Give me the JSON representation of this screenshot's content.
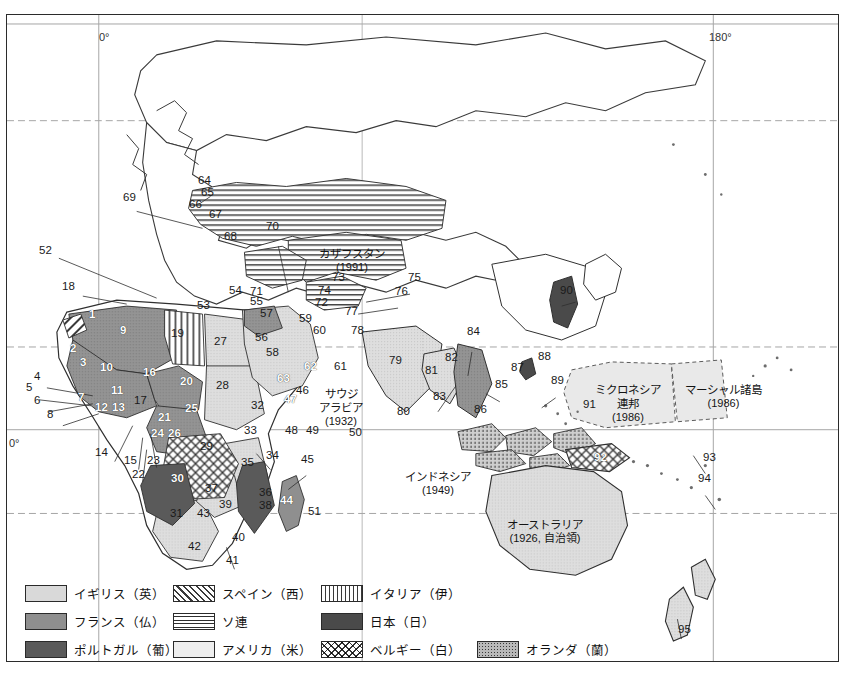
{
  "map": {
    "title_context": "Colonial empires world map with numbered territories",
    "graticule_labels": [
      {
        "id": "meridian-0-top",
        "text": "0°",
        "x": 98,
        "y": 16
      },
      {
        "id": "meridian-180-top",
        "text": "180°",
        "x": 708,
        "y": 16
      },
      {
        "id": "equator-left",
        "text": "0°",
        "x": 6,
        "y": 430
      }
    ],
    "country_labels": [
      {
        "id": "kazakhstan",
        "name": "カザフスタン",
        "year": "(1991)",
        "x": 322,
        "y": 236
      },
      {
        "id": "saudi-arabia",
        "name": "サウジ\nアラビア",
        "line1": "サウジ",
        "line2": "アラビア",
        "year": "(1932)",
        "x": 322,
        "y": 381
      },
      {
        "id": "indonesia",
        "name": "インドネシア",
        "year": "(1949)",
        "x": 411,
        "y": 462
      },
      {
        "id": "australia",
        "name": "オーストラリア",
        "year": "(1926, 自治領)",
        "x": 518,
        "y": 510
      },
      {
        "id": "micronesia",
        "line1": "ミクロネシア",
        "line2": "連邦",
        "year": "(1986)",
        "x": 604,
        "y": 379
      },
      {
        "id": "marshall-islands",
        "name": "マーシャル諸島",
        "year": "(1986)",
        "x": 694,
        "y": 379
      }
    ],
    "region_numbers": [
      {
        "n": "52",
        "x": 38,
        "y": 250,
        "white": false
      },
      {
        "n": "18",
        "x": 61,
        "y": 286,
        "white": false
      },
      {
        "n": "1",
        "x": 88,
        "y": 314,
        "white": true
      },
      {
        "n": "9",
        "x": 119,
        "y": 330,
        "white": true
      },
      {
        "n": "2",
        "x": 69,
        "y": 348,
        "white": true
      },
      {
        "n": "3",
        "x": 79,
        "y": 362,
        "white": true
      },
      {
        "n": "10",
        "x": 99,
        "y": 367,
        "white": true
      },
      {
        "n": "16",
        "x": 142,
        "y": 372,
        "white": true
      },
      {
        "n": "20",
        "x": 179,
        "y": 381,
        "white": true
      },
      {
        "n": "4",
        "x": 33,
        "y": 376,
        "white": false
      },
      {
        "n": "5",
        "x": 25,
        "y": 387,
        "white": false
      },
      {
        "n": "11",
        "x": 110,
        "y": 390,
        "white": true
      },
      {
        "n": "6",
        "x": 33,
        "y": 400,
        "white": false
      },
      {
        "n": "7",
        "x": 77,
        "y": 397,
        "white": true
      },
      {
        "n": "12",
        "x": 94,
        "y": 407,
        "white": true
      },
      {
        "n": "13",
        "x": 111,
        "y": 407,
        "white": true
      },
      {
        "n": "8",
        "x": 46,
        "y": 414,
        "white": false
      },
      {
        "n": "17",
        "x": 133,
        "y": 400,
        "white": false
      },
      {
        "n": "25",
        "x": 184,
        "y": 408,
        "white": true
      },
      {
        "n": "21",
        "x": 157,
        "y": 417,
        "white": true
      },
      {
        "n": "24",
        "x": 150,
        "y": 433,
        "white": true
      },
      {
        "n": "26",
        "x": 167,
        "y": 433,
        "white": true
      },
      {
        "n": "14",
        "x": 94,
        "y": 452,
        "white": false
      },
      {
        "n": "15",
        "x": 123,
        "y": 460,
        "white": false
      },
      {
        "n": "22",
        "x": 131,
        "y": 474,
        "white": false
      },
      {
        "n": "23",
        "x": 146,
        "y": 460,
        "white": false
      },
      {
        "n": "29",
        "x": 199,
        "y": 446,
        "white": false
      },
      {
        "n": "30",
        "x": 170,
        "y": 478,
        "white": true
      },
      {
        "n": "37",
        "x": 204,
        "y": 488,
        "white": false
      },
      {
        "n": "39",
        "x": 218,
        "y": 504,
        "white": false
      },
      {
        "n": "31",
        "x": 169,
        "y": 513,
        "white": false
      },
      {
        "n": "43",
        "x": 196,
        "y": 513,
        "white": false
      },
      {
        "n": "42",
        "x": 187,
        "y": 546,
        "white": false
      },
      {
        "n": "40",
        "x": 231,
        "y": 537,
        "white": false
      },
      {
        "n": "41",
        "x": 225,
        "y": 560,
        "white": false
      },
      {
        "n": "19",
        "x": 170,
        "y": 333,
        "white": false
      },
      {
        "n": "27",
        "x": 213,
        "y": 341,
        "white": false
      },
      {
        "n": "28",
        "x": 215,
        "y": 385,
        "white": false
      },
      {
        "n": "32",
        "x": 250,
        "y": 405,
        "white": false
      },
      {
        "n": "33",
        "x": 243,
        "y": 430,
        "white": false
      },
      {
        "n": "34",
        "x": 265,
        "y": 455,
        "white": false
      },
      {
        "n": "35",
        "x": 240,
        "y": 462,
        "white": false
      },
      {
        "n": "36",
        "x": 258,
        "y": 492,
        "white": false
      },
      {
        "n": "38",
        "x": 258,
        "y": 505,
        "white": false
      },
      {
        "n": "44",
        "x": 279,
        "y": 500,
        "white": true
      },
      {
        "n": "45",
        "x": 300,
        "y": 459,
        "white": false
      },
      {
        "n": "51",
        "x": 307,
        "y": 511,
        "white": false
      },
      {
        "n": "46",
        "x": 295,
        "y": 390,
        "white": false
      },
      {
        "n": "47",
        "x": 283,
        "y": 399,
        "white": true
      },
      {
        "n": "48",
        "x": 284,
        "y": 430,
        "white": false
      },
      {
        "n": "49",
        "x": 305,
        "y": 430,
        "white": false
      },
      {
        "n": "50",
        "x": 348,
        "y": 432,
        "white": false
      },
      {
        "n": "53",
        "x": 196,
        "y": 305,
        "white": false
      },
      {
        "n": "54",
        "x": 228,
        "y": 290,
        "white": false
      },
      {
        "n": "55",
        "x": 249,
        "y": 301,
        "white": false
      },
      {
        "n": "57",
        "x": 259,
        "y": 313,
        "white": false
      },
      {
        "n": "56",
        "x": 254,
        "y": 337,
        "white": false
      },
      {
        "n": "58",
        "x": 265,
        "y": 352,
        "white": false
      },
      {
        "n": "59",
        "x": 298,
        "y": 318,
        "white": false
      },
      {
        "n": "60",
        "x": 312,
        "y": 330,
        "white": false
      },
      {
        "n": "61",
        "x": 333,
        "y": 366,
        "white": false
      },
      {
        "n": "62",
        "x": 303,
        "y": 366,
        "white": true
      },
      {
        "n": "63",
        "x": 276,
        "y": 378,
        "white": true
      },
      {
        "n": "64",
        "x": 197,
        "y": 180,
        "white": false
      },
      {
        "n": "65",
        "x": 200,
        "y": 192,
        "white": false
      },
      {
        "n": "66",
        "x": 188,
        "y": 204,
        "white": false
      },
      {
        "n": "67",
        "x": 208,
        "y": 214,
        "white": false
      },
      {
        "n": "68",
        "x": 223,
        "y": 236,
        "white": false
      },
      {
        "n": "69",
        "x": 122,
        "y": 197,
        "white": false
      },
      {
        "n": "70",
        "x": 265,
        "y": 226,
        "white": false
      },
      {
        "n": "71",
        "x": 249,
        "y": 291,
        "white": false
      },
      {
        "n": "72",
        "x": 314,
        "y": 302,
        "white": false
      },
      {
        "n": "73",
        "x": 331,
        "y": 277,
        "white": false
      },
      {
        "n": "74",
        "x": 317,
        "y": 290,
        "white": false
      },
      {
        "n": "75",
        "x": 407,
        "y": 277,
        "white": false
      },
      {
        "n": "76",
        "x": 394,
        "y": 291,
        "white": false
      },
      {
        "n": "77",
        "x": 344,
        "y": 311,
        "white": false
      },
      {
        "n": "78",
        "x": 350,
        "y": 330,
        "white": false
      },
      {
        "n": "79",
        "x": 388,
        "y": 360,
        "white": false
      },
      {
        "n": "80",
        "x": 396,
        "y": 411,
        "white": false
      },
      {
        "n": "81",
        "x": 424,
        "y": 370,
        "white": false
      },
      {
        "n": "82",
        "x": 444,
        "y": 357,
        "white": false
      },
      {
        "n": "83",
        "x": 432,
        "y": 396,
        "white": false
      },
      {
        "n": "84",
        "x": 466,
        "y": 331,
        "white": false
      },
      {
        "n": "85",
        "x": 494,
        "y": 384,
        "white": false
      },
      {
        "n": "86",
        "x": 473,
        "y": 409,
        "white": false
      },
      {
        "n": "87",
        "x": 510,
        "y": 367,
        "white": false
      },
      {
        "n": "88",
        "x": 537,
        "y": 356,
        "white": false
      },
      {
        "n": "89",
        "x": 550,
        "y": 380,
        "white": false
      },
      {
        "n": "90",
        "x": 559,
        "y": 290,
        "white": false
      },
      {
        "n": "91",
        "x": 582,
        "y": 404,
        "white": false
      },
      {
        "n": "92",
        "x": 593,
        "y": 457,
        "white": true
      },
      {
        "n": "93",
        "x": 702,
        "y": 457,
        "white": false
      },
      {
        "n": "94",
        "x": 697,
        "y": 478,
        "white": false
      },
      {
        "n": "95",
        "x": 677,
        "y": 629,
        "white": false
      }
    ]
  },
  "legend": {
    "items": [
      {
        "id": "uk",
        "label": "イギリス（英）",
        "pattern": "p-uk",
        "col": 0,
        "row": 0
      },
      {
        "id": "spain",
        "label": "スペイン（西）",
        "pattern": "p-es",
        "col": 1,
        "row": 0
      },
      {
        "id": "italy",
        "label": "イタリア（伊）",
        "pattern": "p-it",
        "col": 2,
        "row": 0
      },
      {
        "id": "france",
        "label": "フランス（仏）",
        "pattern": "p-fr",
        "col": 0,
        "row": 1
      },
      {
        "id": "ussr",
        "label": "ソ連",
        "pattern": "p-su",
        "col": 1,
        "row": 1
      },
      {
        "id": "japan",
        "label": "日本（日）",
        "pattern": "p-jp",
        "col": 2,
        "row": 1
      },
      {
        "id": "portugal",
        "label": "ポルトガル（葡）",
        "pattern": "p-pt",
        "col": 0,
        "row": 2
      },
      {
        "id": "usa",
        "label": "アメリカ（米）",
        "pattern": "p-us",
        "col": 1,
        "row": 2
      },
      {
        "id": "belgium",
        "label": "ベルギー（白）",
        "pattern": "p-be",
        "col": 2,
        "row": 2
      },
      {
        "id": "netherlands",
        "label": "オランダ（蘭）",
        "pattern": "p-nl",
        "col": 3,
        "row": 2
      }
    ],
    "col_x": [
      0,
      148,
      296,
      452
    ],
    "row_y": [
      0,
      28,
      56
    ]
  },
  "colors": {
    "uk": "#d9d9d9",
    "france": "#8f8f8f",
    "portugal": "#5a5a5a",
    "usa": "#eeeeee",
    "japan": "#4a4a4a",
    "netherlands": "#b9b9b9",
    "coastline": "#3a3a3a",
    "border": "#2b2b2b",
    "graticule": "#9a9a9a"
  }
}
